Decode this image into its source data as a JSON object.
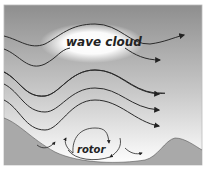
{
  "labels": {
    "cloud": "wave cloud",
    "rotor": "rotor"
  },
  "colors": {
    "sky_top": "#9a9a9a",
    "sky_bottom": "#ffffff",
    "terrain": "#a8a8a8",
    "lines": "#2a2a2a",
    "cloud": "#ffffff",
    "frame": "#bdbdbd"
  }
}
